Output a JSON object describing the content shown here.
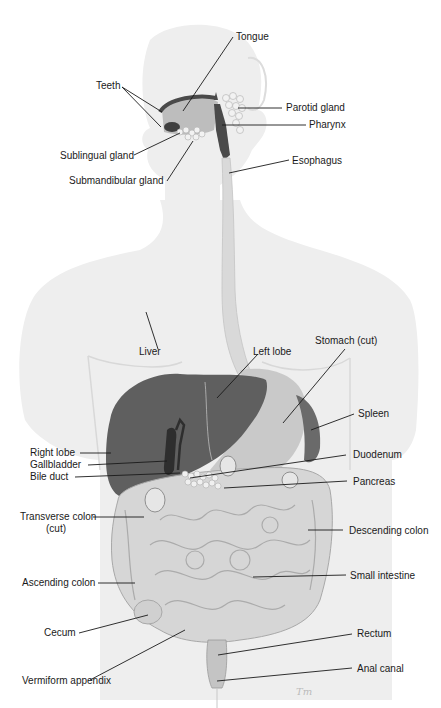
{
  "diagram": {
    "type": "anatomical illustration",
    "signature": "Tm",
    "colors": {
      "body_silhouette": "#ececec",
      "liver": "#5f5f5f",
      "gallbladder": "#2e2e2e",
      "stomach": "#c9c9c9",
      "spleen": "#6a6a6a",
      "intestine": "#d6d6d6",
      "intestine_outline": "#a8a8a8",
      "esophagus": "#d8d8d8",
      "pharynx": "#4a4a4a",
      "leader_line": "#1a1a1a",
      "text": "#1a1a1a"
    }
  },
  "labels": {
    "tongue": "Tongue",
    "teeth": "Teeth",
    "parotid_gland": "Parotid gland",
    "pharynx": "Pharynx",
    "sublingual_gland": "Sublingual gland",
    "esophagus": "Esophagus",
    "submandibular_gland": "Submandibular  gland",
    "liver": "Liver",
    "left_lobe": "Left lobe",
    "stomach": "Stomach (cut)",
    "spleen": "Spleen",
    "right_lobe": "Right lobe",
    "gallbladder": "Gallbladder",
    "bile_duct": "Bile duct",
    "duodenum": "Duodenum",
    "pancreas": "Pancreas",
    "transverse_colon_1": "Transverse colon",
    "transverse_colon_2": "(cut)",
    "descending_colon": "Descending colon",
    "ascending_colon": "Ascending colon",
    "small_intestine": "Small intestine",
    "cecum": "Cecum",
    "rectum": "Rectum",
    "vermiform_appendix": "Vermiform appendix",
    "anal_canal": "Anal canal"
  }
}
